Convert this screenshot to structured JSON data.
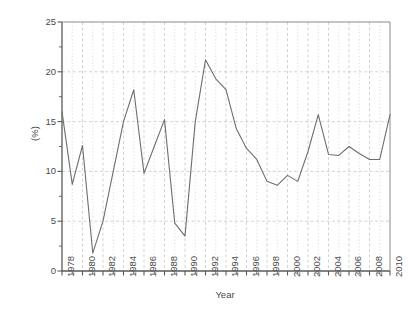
{
  "chart_data": {
    "type": "line",
    "title": "",
    "subtitle": "",
    "xlabel": "Year",
    "ylabel": "(%)",
    "xlim": [
      1978,
      2010
    ],
    "ylim": [
      0,
      25
    ],
    "ytick_values": [
      0,
      5,
      10,
      15,
      20,
      25
    ],
    "ytick_labels": [
      "0",
      "5",
      "10",
      "15",
      "20",
      "25"
    ],
    "xtick_values": [
      1978,
      1980,
      1982,
      1984,
      1986,
      1988,
      1990,
      1992,
      1994,
      1996,
      1998,
      2000,
      2002,
      2004,
      2006,
      2008,
      2010
    ],
    "xtick_labels": [
      "1978",
      "1980",
      "1982",
      "1984",
      "1986",
      "1988",
      "1990",
      "1992",
      "1994",
      "1996",
      "1998",
      "2000",
      "2002",
      "2004",
      "2006",
      "2008",
      "2010"
    ],
    "minor_xticks_every": 1,
    "grid": {
      "x_major": true,
      "x_minor": true,
      "y_major": true,
      "style": "dashed",
      "color": "#c8c8c8"
    },
    "legend": null,
    "legend_position": "none",
    "line_color": "#6e6e6e",
    "line_width": 1.1,
    "markers": "none",
    "x": [
      1978,
      1979,
      1980,
      1981,
      1982,
      1983,
      1984,
      1985,
      1986,
      1987,
      1988,
      1989,
      1990,
      1991,
      1992,
      1993,
      1994,
      1995,
      1996,
      1997,
      1998,
      1999,
      2000,
      2001,
      2002,
      2003,
      2004,
      2005,
      2006,
      2007,
      2008,
      2009,
      2010
    ],
    "values": [
      16.0,
      8.7,
      12.6,
      1.8,
      5.0,
      10.0,
      15.0,
      18.2,
      9.8,
      12.5,
      15.2,
      4.8,
      3.5,
      15.0,
      21.2,
      19.3,
      18.2,
      14.3,
      12.3,
      11.2,
      9.0,
      8.6,
      9.6,
      9.0,
      12.0,
      15.7,
      11.7,
      11.6,
      12.5,
      11.8,
      11.2,
      11.2,
      15.7
    ],
    "series": [
      {
        "name": "percentage",
        "values": [
          16.0,
          8.7,
          12.6,
          1.8,
          5.0,
          10.0,
          15.0,
          18.2,
          9.8,
          12.5,
          15.2,
          4.8,
          3.5,
          15.0,
          21.2,
          19.3,
          18.2,
          14.3,
          12.3,
          11.2,
          9.0,
          8.6,
          9.6,
          9.0,
          12.0,
          15.7,
          11.7,
          11.6,
          12.5,
          11.8,
          11.2,
          11.2,
          15.7
        ]
      }
    ],
    "annotations": []
  },
  "geometry": {
    "plot_left": 62,
    "plot_right": 390,
    "plot_top": 22,
    "plot_bottom": 271
  }
}
